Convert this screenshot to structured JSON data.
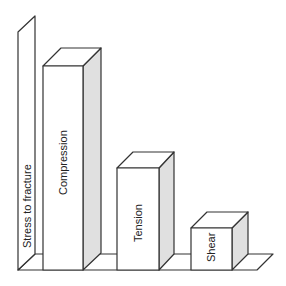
{
  "diagram": {
    "axis_label": "Stress to fracture",
    "bars": [
      {
        "label": "Compression",
        "relative_height": 204
      },
      {
        "label": "Tension",
        "relative_height": 102
      },
      {
        "label": "Shear",
        "relative_height": 42
      }
    ],
    "colors": {
      "line": "#333333",
      "side_face": "#e0e0e0",
      "front_face": "#ffffff"
    }
  }
}
